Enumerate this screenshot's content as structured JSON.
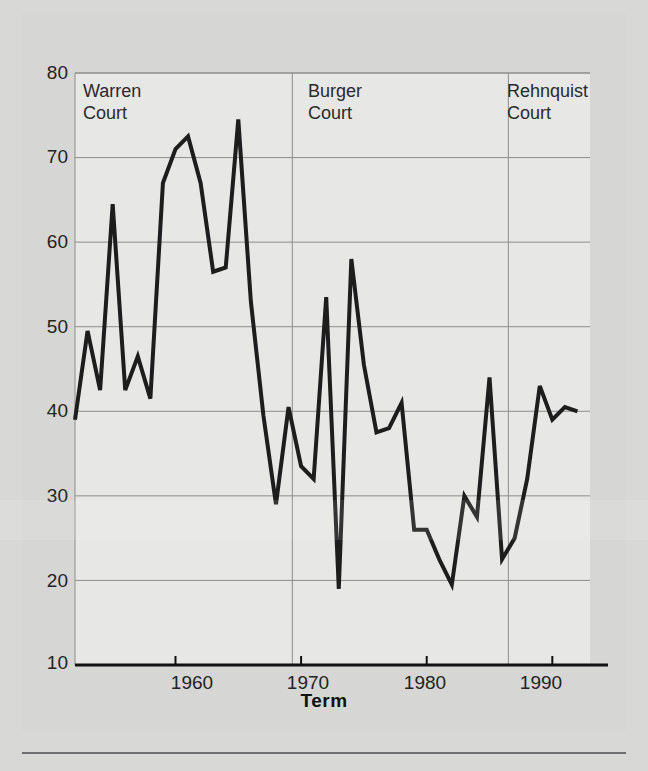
{
  "chart_data": {
    "type": "line",
    "title": "",
    "subtitle": "",
    "xlabel": "Term",
    "ylabel": "",
    "xlim": [
      1952,
      1993
    ],
    "ylim": [
      10,
      80
    ],
    "grid": true,
    "legend_position": "none",
    "x_ticks": [
      1960,
      1970,
      1980,
      1990
    ],
    "x_tick_labels": [
      "1960",
      "1970",
      "1980",
      "1990"
    ],
    "y_ticks": [
      10,
      20,
      30,
      40,
      50,
      60,
      70,
      80
    ],
    "y_tick_labels": [
      "10",
      "20",
      "30",
      "40",
      "50",
      "60",
      "70",
      "80"
    ],
    "line_color": "#1d1d1d",
    "line_width": 4,
    "series": [
      {
        "name": "Term",
        "x": [
          1952,
          1953,
          1954,
          1955,
          1956,
          1957,
          1958,
          1959,
          1960,
          1961,
          1962,
          1963,
          1964,
          1965,
          1966,
          1967,
          1968,
          1969,
          1970,
          1971,
          1972,
          1973,
          1974,
          1975,
          1976,
          1977,
          1978,
          1979,
          1980,
          1981,
          1982,
          1983,
          1984,
          1985,
          1986,
          1987,
          1988,
          1989,
          1990,
          1991,
          1992
        ],
        "values": [
          39,
          49.5,
          42.5,
          64.5,
          42.5,
          46.5,
          41.5,
          67,
          71,
          72.5,
          67,
          56.5,
          57,
          74.5,
          53,
          39.5,
          29,
          40.5,
          33.5,
          32,
          53.5,
          19,
          58,
          45.5,
          37.5,
          38,
          41,
          26,
          26,
          22.5,
          19.5,
          30,
          27.5,
          44,
          22.5,
          25,
          32,
          43,
          39,
          40.5,
          40
        ]
      }
    ],
    "annotations": [
      {
        "label": "Warren\nCourt",
        "era_start": 1952,
        "era_end": 1969
      },
      {
        "label": "Burger\nCourt",
        "era_start": 1969,
        "era_end": 1986
      },
      {
        "label": "Rehnquist\nCourt",
        "era_start": 1986,
        "era_end": 1993
      }
    ],
    "era_dividers": [
      1969.3,
      1986.5
    ]
  },
  "labels": {
    "warren": "Warren\nCourt",
    "burger": "Burger\nCourt",
    "rehnquist": "Rehnquist\nCourt",
    "xaxis_title": "Term"
  }
}
